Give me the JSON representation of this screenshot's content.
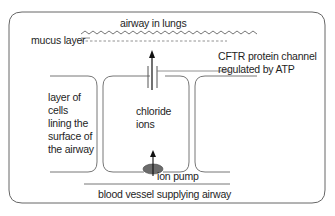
{
  "diagram": {
    "title_airway": "airway in lungs",
    "mucus_label": "mucus layer",
    "channel_label_line1": "CFTR protein channel",
    "channel_label_line2": "regulated by ATP",
    "cells_label": [
      "layer of",
      "cells",
      "lining the",
      "surface of",
      "the airway"
    ],
    "ions_label": [
      "chloride",
      "ions"
    ],
    "pump_label": "ion pump",
    "blood_label": "blood vessel supplying airway",
    "colors": {
      "line": "#555555",
      "frame": "#666666",
      "pump_fill": "#6b6b6b",
      "arrow": "#111111"
    }
  }
}
